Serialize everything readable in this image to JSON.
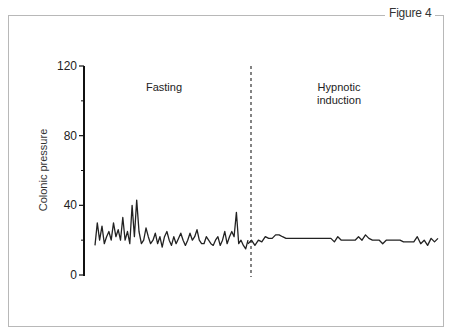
{
  "figure": {
    "label": "Figure 4"
  },
  "chart_data": {
    "type": "line",
    "title": "",
    "xlabel": "",
    "ylabel": "Colonic pressure",
    "ylim": [
      0,
      120
    ],
    "yticks_major": [
      0,
      40,
      80,
      120
    ],
    "yticks_minor": [
      20,
      60,
      100
    ],
    "grid": false,
    "legend": null,
    "annotations": [
      {
        "text": "Fasting",
        "region": "left"
      },
      {
        "text": "Hypnotic induction",
        "lines": [
          "Hypnotic",
          "induction"
        ],
        "region": "right"
      },
      {
        "type": "vertical-dashed-line",
        "position": "boundary between Fasting and Hypnotic induction"
      }
    ],
    "series": [
      {
        "name": "Fasting",
        "values": [
          17,
          30,
          20,
          28,
          18,
          22,
          25,
          20,
          30,
          22,
          26,
          20,
          33,
          20,
          25,
          18,
          40,
          22,
          43,
          25,
          18,
          20,
          27,
          22,
          18,
          20,
          24,
          18,
          22,
          16,
          22,
          25,
          20,
          17,
          22,
          18,
          21,
          24,
          20,
          17,
          20,
          24,
          20,
          22,
          26,
          20,
          18,
          18,
          22,
          20,
          18,
          17,
          20,
          22,
          17,
          20,
          25,
          18,
          22,
          25,
          22,
          36,
          18,
          20,
          17,
          15,
          20
        ]
      },
      {
        "name": "Hypnotic induction",
        "values": [
          18,
          20,
          17,
          20,
          19,
          22,
          21,
          21,
          23,
          23,
          22,
          21,
          21,
          21,
          21,
          21,
          21,
          21,
          21,
          21,
          21,
          21,
          21,
          21,
          21,
          19,
          22,
          20,
          20,
          20,
          20,
          20,
          22,
          20,
          23,
          21,
          20,
          20,
          20,
          18,
          20,
          20,
          20,
          20,
          20,
          19,
          19,
          19,
          19,
          22,
          18,
          20,
          17,
          21,
          19,
          21
        ]
      }
    ]
  }
}
